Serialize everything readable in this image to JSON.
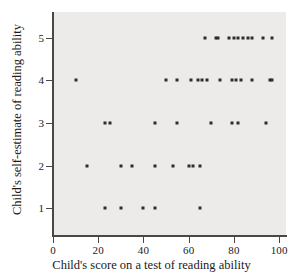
{
  "chart_data": {
    "type": "scatter",
    "title": "",
    "xlabel": "Child's score on a test of reading ability",
    "ylabel": "Child's self-estimate of reading ability",
    "xlim": [
      0,
      103
    ],
    "ylim": [
      0.35,
      5.6
    ],
    "xticks": [
      0,
      20,
      40,
      60,
      80,
      100
    ],
    "yticks": [
      1,
      2,
      3,
      4,
      5
    ],
    "grid": false,
    "legend": null,
    "marker": "square",
    "marker_color": "#2e2c2a",
    "panel_color": "#ecebe9",
    "axis_color": "#4a4744",
    "points": [
      {
        "x": 10,
        "y": 4
      },
      {
        "x": 15,
        "y": 2
      },
      {
        "x": 23,
        "y": 1
      },
      {
        "x": 23,
        "y": 3
      },
      {
        "x": 25,
        "y": 3
      },
      {
        "x": 30,
        "y": 1
      },
      {
        "x": 30,
        "y": 2
      },
      {
        "x": 35,
        "y": 2
      },
      {
        "x": 40,
        "y": 1
      },
      {
        "x": 45,
        "y": 1
      },
      {
        "x": 45,
        "y": 2
      },
      {
        "x": 45,
        "y": 3
      },
      {
        "x": 50,
        "y": 4
      },
      {
        "x": 53,
        "y": 2
      },
      {
        "x": 55,
        "y": 3
      },
      {
        "x": 55,
        "y": 4
      },
      {
        "x": 60,
        "y": 2
      },
      {
        "x": 61,
        "y": 4
      },
      {
        "x": 62,
        "y": 2
      },
      {
        "x": 64,
        "y": 4
      },
      {
        "x": 65,
        "y": 1
      },
      {
        "x": 65,
        "y": 2
      },
      {
        "x": 66,
        "y": 4
      },
      {
        "x": 67,
        "y": 5
      },
      {
        "x": 68,
        "y": 4
      },
      {
        "x": 70,
        "y": 3
      },
      {
        "x": 72,
        "y": 5
      },
      {
        "x": 73,
        "y": 5
      },
      {
        "x": 74,
        "y": 4
      },
      {
        "x": 78,
        "y": 5
      },
      {
        "x": 79,
        "y": 3
      },
      {
        "x": 79,
        "y": 4
      },
      {
        "x": 80,
        "y": 5
      },
      {
        "x": 81,
        "y": 4
      },
      {
        "x": 82,
        "y": 3
      },
      {
        "x": 82,
        "y": 5
      },
      {
        "x": 83,
        "y": 4
      },
      {
        "x": 84,
        "y": 5
      },
      {
        "x": 86,
        "y": 5
      },
      {
        "x": 88,
        "y": 4
      },
      {
        "x": 88,
        "y": 5
      },
      {
        "x": 93,
        "y": 5
      },
      {
        "x": 94,
        "y": 3
      },
      {
        "x": 96,
        "y": 4
      },
      {
        "x": 97,
        "y": 4
      },
      {
        "x": 97,
        "y": 5
      }
    ]
  }
}
